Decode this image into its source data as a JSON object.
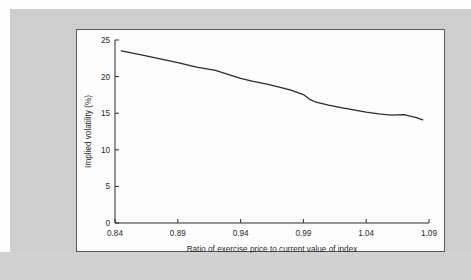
{
  "figure": {
    "panel_background": "#fdfdfd",
    "page_background": "#cfcfcf",
    "border_color": "#555a5f",
    "line_color": "#2b2b2b"
  },
  "chart_data": {
    "type": "line",
    "title": "",
    "xlabel": "Ratio of exercise price to current value of index",
    "ylabel": "Implied volatility (%)",
    "xlim": [
      0.84,
      1.09
    ],
    "ylim": [
      0,
      25
    ],
    "xticks": [
      0.84,
      0.89,
      0.94,
      0.99,
      1.04,
      1.09
    ],
    "xtick_labels": [
      "0.84",
      "0.89",
      "0.94",
      "0.99",
      "1.04",
      "1.09"
    ],
    "yticks": [
      0,
      5,
      10,
      15,
      20,
      25
    ],
    "ytick_labels": [
      "0",
      "5",
      "10",
      "15",
      "20",
      "25"
    ],
    "grid": false,
    "legend": null,
    "series": [
      {
        "name": "Implied volatility",
        "x": [
          0.845,
          0.86,
          0.875,
          0.89,
          0.905,
          0.92,
          0.93,
          0.94,
          0.95,
          0.96,
          0.97,
          0.98,
          0.99,
          0.995,
          1.0,
          1.01,
          1.02,
          1.03,
          1.04,
          1.05,
          1.06,
          1.07,
          1.08,
          1.085
        ],
        "y": [
          23.5,
          23.0,
          22.45,
          21.9,
          21.3,
          20.85,
          20.3,
          19.75,
          19.35,
          19.0,
          18.6,
          18.15,
          17.55,
          16.9,
          16.5,
          16.1,
          15.75,
          15.45,
          15.15,
          14.9,
          14.75,
          14.8,
          14.4,
          14.1
        ]
      }
    ]
  }
}
